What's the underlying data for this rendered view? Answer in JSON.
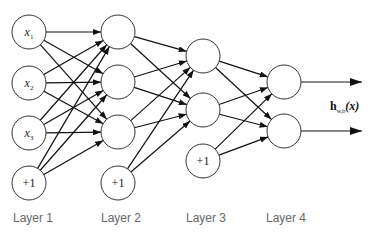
{
  "diagram": {
    "layers": [
      {
        "label": "Layer 1",
        "nodes": [
          "x1",
          "x2",
          "x3",
          "+1"
        ]
      },
      {
        "label": "Layer 2",
        "nodes": [
          "",
          "",
          "",
          "+1"
        ]
      },
      {
        "label": "Layer 3",
        "nodes": [
          "",
          "",
          "+1"
        ]
      },
      {
        "label": "Layer 4",
        "nodes": [
          "",
          ""
        ]
      }
    ],
    "output_label": {
      "main": "h",
      "sub": "w,b",
      "arg": "(x)"
    },
    "input_labels": {
      "x1": {
        "var": "x",
        "sub": "1"
      },
      "x2": {
        "var": "x",
        "sub": "2"
      },
      "x3": {
        "var": "x",
        "sub": "3"
      },
      "bias": "+1"
    },
    "colors": {
      "stroke": "#222222",
      "label": "#666666"
    }
  }
}
